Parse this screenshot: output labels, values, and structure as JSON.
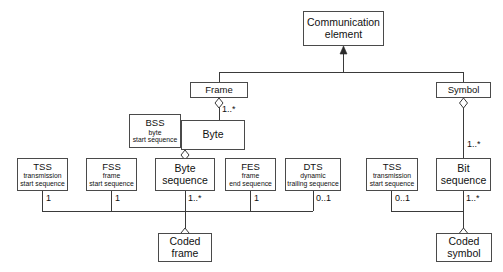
{
  "diagram": {
    "type": "uml-class-diagram",
    "colors": {
      "stroke": "#4a4a4a",
      "line": "#3a3a3a",
      "text": "#111111",
      "background": "#ffffff"
    },
    "nodes": [
      {
        "id": "communication_element",
        "title": "Communication",
        "subtitle": "element",
        "x": 303,
        "y": 11,
        "w": 81,
        "h": 35,
        "style": "big"
      },
      {
        "id": "frame",
        "title": "Frame",
        "subtitle": "",
        "x": 190,
        "y": 82,
        "w": 58,
        "h": 16,
        "style": "plain"
      },
      {
        "id": "symbol",
        "title": "Symbol",
        "subtitle": "",
        "x": 436,
        "y": 82,
        "w": 55,
        "h": 16,
        "style": "plain"
      },
      {
        "id": "bss",
        "title": "BSS",
        "subtitle": "byte\nstart sequence",
        "x": 129,
        "y": 114,
        "w": 52,
        "h": 34,
        "style": "abbrev"
      },
      {
        "id": "byte",
        "title": "Byte",
        "subtitle": "",
        "x": 181,
        "y": 120,
        "w": 64,
        "h": 30,
        "style": "big"
      },
      {
        "id": "tss_frame",
        "title": "TSS",
        "subtitle": "transmission\nstart sequence",
        "x": 17,
        "y": 158,
        "w": 51,
        "h": 33,
        "style": "abbrev"
      },
      {
        "id": "fss",
        "title": "FSS",
        "subtitle": "frame\nstart sequence",
        "x": 86,
        "y": 158,
        "w": 51,
        "h": 33,
        "style": "abbrev"
      },
      {
        "id": "byte_sequence",
        "title": "Byte",
        "subtitle": "sequence",
        "x": 155,
        "y": 158,
        "w": 60,
        "h": 33,
        "style": "big"
      },
      {
        "id": "fes",
        "title": "FES",
        "subtitle": "frame\nend sequence",
        "x": 225,
        "y": 158,
        "w": 51,
        "h": 33,
        "style": "abbrev"
      },
      {
        "id": "dts",
        "title": "DTS",
        "subtitle": "dynamic\ntrailing sequence",
        "x": 285,
        "y": 158,
        "w": 56,
        "h": 33,
        "style": "abbrev"
      },
      {
        "id": "tss_symbol",
        "title": "TSS",
        "subtitle": "transmission\nstart sequence",
        "x": 366,
        "y": 158,
        "w": 52,
        "h": 33,
        "style": "abbrev"
      },
      {
        "id": "bit_sequence",
        "title": "Bit",
        "subtitle": "sequence",
        "x": 436,
        "y": 158,
        "w": 55,
        "h": 33,
        "style": "big"
      },
      {
        "id": "coded_frame",
        "title": "Coded",
        "subtitle": "frame",
        "x": 158,
        "y": 233,
        "w": 54,
        "h": 29,
        "style": "big"
      },
      {
        "id": "coded_symbol",
        "title": "Coded",
        "subtitle": "symbol",
        "x": 436,
        "y": 233,
        "w": 56,
        "h": 29,
        "style": "big"
      }
    ],
    "multiplicities": [
      {
        "id": "frame_byte",
        "label": "1..*",
        "x": 222,
        "y": 104
      },
      {
        "id": "symbol_bit",
        "label": "1..*",
        "x": 467,
        "y": 139
      },
      {
        "id": "tss_frame_mult",
        "label": "1",
        "x": 46,
        "y": 196
      },
      {
        "id": "fss_mult",
        "label": "1",
        "x": 115,
        "y": 196
      },
      {
        "id": "byte_sequence_mult",
        "label": "1..*",
        "x": 188,
        "y": 196
      },
      {
        "id": "fes_mult",
        "label": "1",
        "x": 254,
        "y": 196
      },
      {
        "id": "dts_mult",
        "label": "0..1",
        "x": 316,
        "y": 196
      },
      {
        "id": "tss_symbol_mult",
        "label": "0..1",
        "x": 395,
        "y": 196
      },
      {
        "id": "bit_sequence_mult",
        "label": "1..*",
        "x": 466,
        "y": 196
      }
    ],
    "relationships": [
      {
        "id": "frame-generalizes-communication-element",
        "kind": "generalization",
        "from": "frame",
        "to": "communication_element"
      },
      {
        "id": "symbol-generalizes-communication-element",
        "kind": "generalization",
        "from": "symbol",
        "to": "communication_element"
      },
      {
        "id": "frame-aggregates-byte",
        "kind": "aggregation",
        "from": "frame",
        "to": "byte",
        "multiplicity": "1..*"
      },
      {
        "id": "symbol-aggregates-bit-sequence",
        "kind": "aggregation",
        "from": "symbol",
        "to": "bit_sequence",
        "multiplicity": "1..*"
      },
      {
        "id": "byte-aggregates-byte-sequence",
        "kind": "aggregation",
        "from": "byte",
        "to": "byte_sequence"
      },
      {
        "id": "coded-frame-aggregates-parts",
        "kind": "aggregation",
        "from": "coded_frame",
        "to": "tss_frame,fss,byte_sequence,fes,dts"
      },
      {
        "id": "coded-symbol-aggregates-parts",
        "kind": "aggregation",
        "from": "coded_symbol",
        "to": "tss_symbol,bit_sequence"
      }
    ]
  }
}
